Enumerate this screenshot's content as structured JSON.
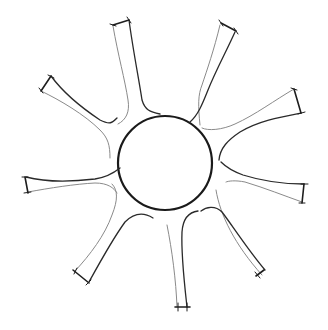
{
  "figure": {
    "title": "",
    "background": "#ffffff",
    "stroke_color": "#1e1e1e",
    "center_circle": {
      "cx": 165,
      "cy": 163,
      "r": 47
    },
    "arm_count": 8,
    "arms": [
      {
        "name": "arm-top-left",
        "cap": [
          [
            113,
            24
          ],
          [
            129,
            20
          ]
        ]
      },
      {
        "name": "arm-top-right",
        "cap": [
          [
            220,
            23
          ],
          [
            236,
            32
          ]
        ]
      },
      {
        "name": "arm-right-upper",
        "cap": [
          [
            294,
            88
          ],
          [
            301,
            114
          ]
        ]
      },
      {
        "name": "arm-right-lower",
        "cap": [
          [
            304,
            184
          ],
          [
            302,
            203
          ]
        ]
      },
      {
        "name": "arm-bottom",
        "cap": [
          [
            176,
            308
          ],
          [
            190,
            307
          ]
        ]
      },
      {
        "name": "arm-bottom-left",
        "cap": [
          [
            73,
            271
          ],
          [
            89,
            282
          ]
        ]
      },
      {
        "name": "arm-left",
        "cap": [
          [
            25,
            177
          ],
          [
            28,
            193
          ]
        ]
      },
      {
        "name": "arm-upper-left",
        "cap": [
          [
            51,
            76
          ],
          [
            41,
            91
          ]
        ]
      }
    ]
  }
}
